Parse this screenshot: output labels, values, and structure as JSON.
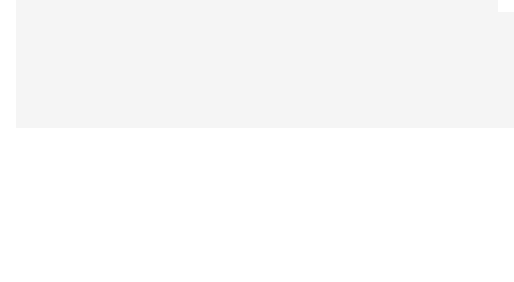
{
  "colors": {
    "background": "#f4f4f4",
    "feasible_region": "#a9a9a9",
    "line": "#1a1a1a",
    "text": "#333333"
  },
  "panel_a": {
    "caption": "(a)",
    "axis_y_label": "x2",
    "axis_x_label": "x1",
    "y_ticks": [
      "18",
      "10"
    ],
    "x_ticks": [
      "11",
      "13"
    ],
    "labels": {
      "storage": "Storage",
      "inspection": "Inspection",
      "assembly": "Assembly",
      "original": "Original objective function",
      "parallel": "Parallel to storage"
    }
  },
  "panel_b": {
    "caption": "(b)",
    "axis_y_label": "x2",
    "axis_x_label": "x1",
    "y_ticks": [
      "18",
      "10"
    ],
    "x_ticks": [
      "11",
      "13"
    ],
    "labels": {
      "storage": "Storage",
      "inspection": "Inspection",
      "assembly": "Assembly",
      "original": "Original objective function",
      "parallel": "Parallel to inspection"
    }
  }
}
